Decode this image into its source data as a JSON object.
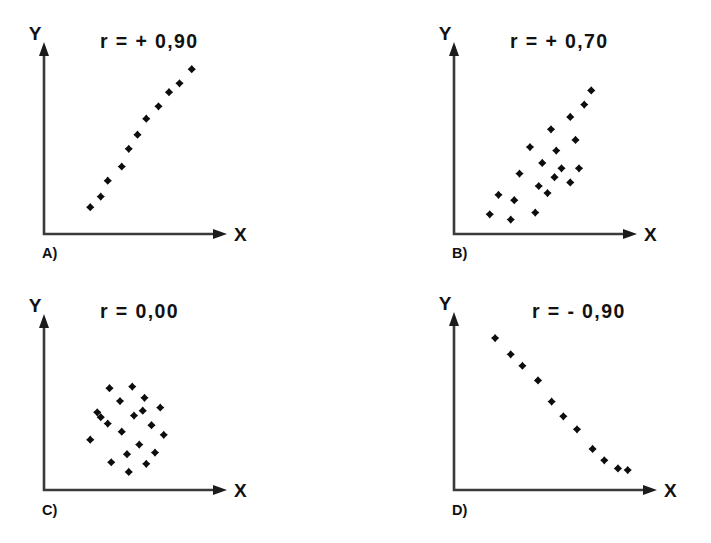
{
  "figure": {
    "background_color": "#ffffff",
    "axis_color": "#3a3a3a",
    "point_color": "#0d0d0d",
    "text_color": "#111111"
  },
  "panels": [
    {
      "key": "a",
      "letter": "A)",
      "r_label": "r = + 0,90",
      "x_axis_label": "X",
      "y_axis_label": "Y"
    },
    {
      "key": "b",
      "letter": "B)",
      "r_label": "r = + 0,70",
      "x_axis_label": "X",
      "y_axis_label": "Y"
    },
    {
      "key": "c",
      "letter": "C)",
      "r_label": "r = 0,00",
      "x_axis_label": "X",
      "y_axis_label": "Y"
    },
    {
      "key": "d",
      "letter": "D)",
      "r_label": "r = - 0,90",
      "x_axis_label": "X",
      "y_axis_label": "Y"
    }
  ],
  "chart_data": [
    {
      "type": "scatter",
      "panel": "A)",
      "title": "r = + 0,90",
      "r": 0.9,
      "xlabel": "X",
      "ylabel": "Y",
      "grid": false,
      "legend": "none",
      "xlim": [
        0,
        100
      ],
      "ylim": [
        0,
        100
      ],
      "axis_ticks": false,
      "n_points": 11,
      "points": [
        {
          "x": 23,
          "y": 14
        },
        {
          "x": 29,
          "y": 20
        },
        {
          "x": 33,
          "y": 29
        },
        {
          "x": 41,
          "y": 37
        },
        {
          "x": 45,
          "y": 47
        },
        {
          "x": 50,
          "y": 55
        },
        {
          "x": 55,
          "y": 64
        },
        {
          "x": 62,
          "y": 71
        },
        {
          "x": 68,
          "y": 79
        },
        {
          "x": 74,
          "y": 84
        },
        {
          "x": 81,
          "y": 92
        }
      ]
    },
    {
      "type": "scatter",
      "panel": "B)",
      "title": "r = + 0,70",
      "r": 0.7,
      "xlabel": "X",
      "ylabel": "Y",
      "grid": false,
      "legend": "none",
      "xlim": [
        0,
        100
      ],
      "ylim": [
        0,
        100
      ],
      "axis_ticks": false,
      "n_points": 20,
      "points": [
        {
          "x": 17,
          "y": 10
        },
        {
          "x": 29,
          "y": 7
        },
        {
          "x": 22,
          "y": 21
        },
        {
          "x": 31,
          "y": 18
        },
        {
          "x": 43,
          "y": 11
        },
        {
          "x": 34,
          "y": 33
        },
        {
          "x": 45,
          "y": 26
        },
        {
          "x": 50,
          "y": 22
        },
        {
          "x": 47,
          "y": 39
        },
        {
          "x": 54,
          "y": 31
        },
        {
          "x": 58,
          "y": 36
        },
        {
          "x": 63,
          "y": 28
        },
        {
          "x": 68,
          "y": 36
        },
        {
          "x": 40,
          "y": 48
        },
        {
          "x": 55,
          "y": 46
        },
        {
          "x": 52,
          "y": 58
        },
        {
          "x": 66,
          "y": 52
        },
        {
          "x": 63,
          "y": 65
        },
        {
          "x": 71,
          "y": 72
        },
        {
          "x": 75,
          "y": 80
        }
      ]
    },
    {
      "type": "scatter",
      "panel": "C)",
      "title": "r = 0,00",
      "r": 0.0,
      "xlabel": "X",
      "ylabel": "Y",
      "grid": false,
      "legend": "none",
      "xlim": [
        0,
        100
      ],
      "ylim": [
        0,
        100
      ],
      "axis_ticks": false,
      "n_points": 20,
      "points": [
        {
          "x": 34,
          "y": 62
        },
        {
          "x": 47,
          "y": 63
        },
        {
          "x": 40,
          "y": 54
        },
        {
          "x": 54,
          "y": 56
        },
        {
          "x": 63,
          "y": 50
        },
        {
          "x": 27,
          "y": 47
        },
        {
          "x": 48,
          "y": 45
        },
        {
          "x": 33,
          "y": 40
        },
        {
          "x": 58,
          "y": 39
        },
        {
          "x": 41,
          "y": 35
        },
        {
          "x": 65,
          "y": 33
        },
        {
          "x": 23,
          "y": 30
        },
        {
          "x": 51,
          "y": 27
        },
        {
          "x": 60,
          "y": 22
        },
        {
          "x": 44,
          "y": 21
        },
        {
          "x": 35,
          "y": 16
        },
        {
          "x": 55,
          "y": 15
        },
        {
          "x": 45,
          "y": 10
        },
        {
          "x": 29,
          "y": 44
        },
        {
          "x": 53,
          "y": 48
        }
      ]
    },
    {
      "type": "scatter",
      "panel": "D)",
      "title": "r = - 0,90",
      "r": -0.9,
      "xlabel": "X",
      "ylabel": "Y",
      "grid": false,
      "legend": "none",
      "xlim": [
        0,
        100
      ],
      "ylim": [
        0,
        100
      ],
      "axis_ticks": false,
      "n_points": 11,
      "points": [
        {
          "x": 18,
          "y": 92
        },
        {
          "x": 26,
          "y": 82
        },
        {
          "x": 32,
          "y": 75
        },
        {
          "x": 40,
          "y": 66
        },
        {
          "x": 47,
          "y": 53
        },
        {
          "x": 53,
          "y": 44
        },
        {
          "x": 60,
          "y": 36
        },
        {
          "x": 68,
          "y": 24
        },
        {
          "x": 74,
          "y": 17
        },
        {
          "x": 81,
          "y": 12
        },
        {
          "x": 86,
          "y": 11
        }
      ]
    }
  ]
}
